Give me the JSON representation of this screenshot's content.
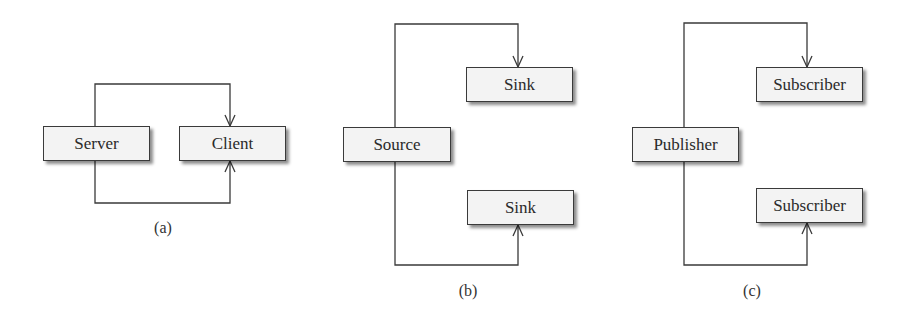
{
  "panels": {
    "a": {
      "caption": "(a)",
      "nodes": {
        "server": "Server",
        "client": "Client"
      }
    },
    "b": {
      "caption": "(b)",
      "nodes": {
        "source": "Source",
        "sink_top": "Sink",
        "sink_bottom": "Sink"
      }
    },
    "c": {
      "caption": "(c)",
      "nodes": {
        "publisher": "Publisher",
        "subscriber_top": "Subscriber",
        "subscriber_bottom": "Subscriber"
      }
    }
  },
  "colors": {
    "line": "#3a3a3a",
    "box_fill": "#f3f3f3",
    "box_border": "#3a3a3a"
  }
}
